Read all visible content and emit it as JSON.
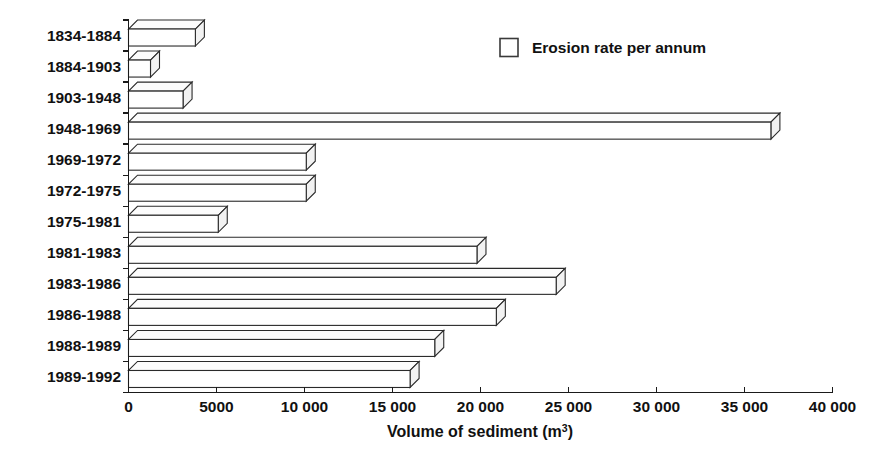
{
  "chart_data": {
    "type": "bar",
    "orientation": "horizontal",
    "title": "",
    "subtitle": "",
    "xlabel": "Volume of sediment (m3)",
    "xlabel_base": "Volume of sediment (m",
    "xlabel_superscript": "3",
    "xlabel_suffix": ")",
    "ylabel": "",
    "categories": [
      "1834-1884",
      "1884-1903",
      "1903-1948",
      "1948-1969",
      "1969-1972",
      "1972-1975",
      "1975-1981",
      "1981-1983",
      "1983-1986",
      "1986-1988",
      "1988-1989",
      "1989-1992"
    ],
    "values": [
      3800,
      1250,
      3100,
      36500,
      10100,
      10100,
      5100,
      19800,
      24300,
      20900,
      17400,
      16000
    ],
    "series": [
      {
        "name": "Erosion rate per annum",
        "values": [
          3800,
          1250,
          3100,
          36500,
          10100,
          10100,
          5100,
          19800,
          24300,
          20900,
          17400,
          16000
        ]
      }
    ],
    "xlim": [
      0,
      40000
    ],
    "xticks": [
      0,
      5000,
      10000,
      15000,
      20000,
      25000,
      30000,
      35000,
      40000
    ],
    "xtick_labels": [
      "0",
      "5000",
      "10 000",
      "15 000",
      "20 000",
      "25 000",
      "30 000",
      "35 000",
      "40 000"
    ],
    "grid": false,
    "style": "3d-isometric-outline",
    "bar_fill": "#ffffff",
    "bar_stroke": "#2a2a2a",
    "legend": {
      "position": "top-right",
      "entries": [
        {
          "label": "Erosion rate per annum",
          "swatch": "empty-square"
        }
      ]
    }
  },
  "legend": {
    "label": "Erosion rate per annum"
  },
  "axis": {
    "title_base": "Volume of sediment (m",
    "title_sup": "3",
    "title_close": ")"
  }
}
